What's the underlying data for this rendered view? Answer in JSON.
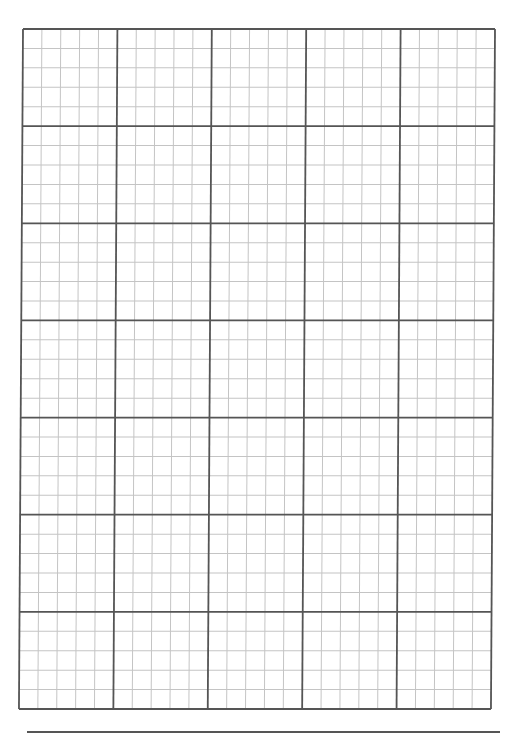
{
  "page": {
    "type": "graph-paper",
    "background": "#ffffff"
  },
  "grid": {
    "major_columns": 5,
    "major_rows": 7,
    "minor_per_major": 5,
    "width_px": 472,
    "height_px": 680,
    "major_line_color": "#555555",
    "minor_line_color": "#c4c4c4",
    "major_line_width": 1.8,
    "minor_line_width": 1
  },
  "footer": {
    "rule_color": "#555555"
  }
}
